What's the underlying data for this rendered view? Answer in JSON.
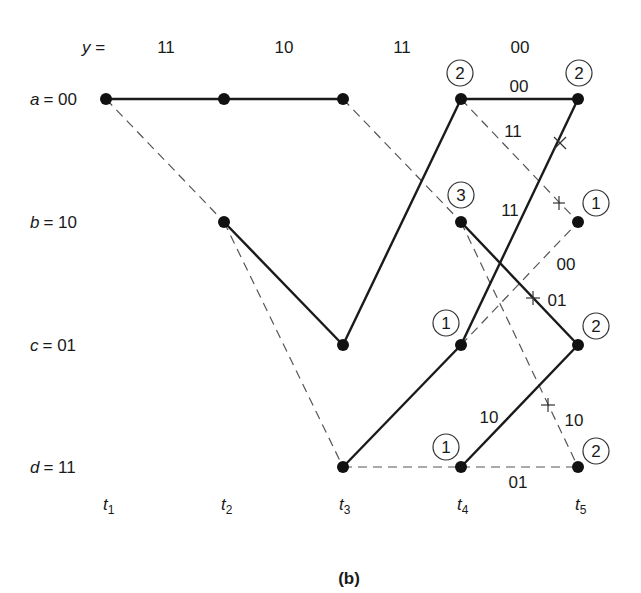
{
  "figure": {
    "caption": "(b)",
    "received_label": "y =",
    "received_sequence": [
      "11",
      "10",
      "11",
      "00"
    ],
    "states": [
      {
        "name": "a",
        "label": "a",
        "value": "= 00"
      },
      {
        "name": "b",
        "label": "b",
        "value": "= 10"
      },
      {
        "name": "c",
        "label": "c",
        "value": "= 01"
      },
      {
        "name": "d",
        "label": "d",
        "value": "= 11"
      }
    ],
    "time_labels": [
      {
        "t": "t",
        "sub": "1"
      },
      {
        "t": "t",
        "sub": "2"
      },
      {
        "t": "t",
        "sub": "3"
      },
      {
        "t": "t",
        "sub": "4"
      },
      {
        "t": "t",
        "sub": "5"
      }
    ],
    "path_metrics": {
      "t4": {
        "a": "2",
        "b": "3",
        "c": "1",
        "d": "1"
      },
      "t5": {
        "a": "2",
        "b": "1",
        "c": "2",
        "d": "2"
      }
    },
    "branch_labels_t4_t5": {
      "a_to_a": "00",
      "a_to_b": "11",
      "b_to_c": "01",
      "b_to_d": "10",
      "c_to_a": "11",
      "c_to_b": "00",
      "d_to_c": "10",
      "d_to_d": "01"
    },
    "legend": {
      "solid": "input bit 0 (surviving branch)",
      "dashed": "input bit 1",
      "cross": "discarded branch"
    }
  }
}
